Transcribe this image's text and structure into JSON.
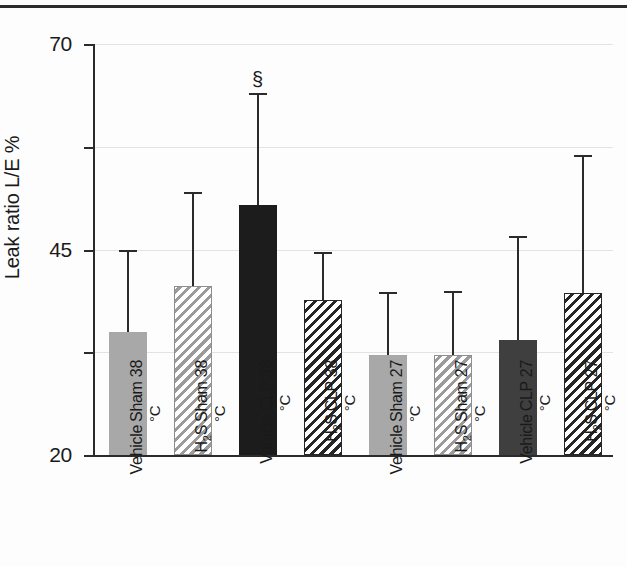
{
  "chart_data": {
    "type": "bar",
    "title": "",
    "subtitle": "",
    "xlabel": "",
    "ylabel": "Leak ratio L/E %",
    "ylim": [
      20,
      70
    ],
    "yticks": [
      20,
      45,
      70
    ],
    "ytick_labels": [
      "20",
      "45",
      "70"
    ],
    "minor_yticks": [
      32.5,
      57.5
    ],
    "grid": true,
    "legend": "none",
    "categories": [
      "Sham 38°C Vehicle",
      "Sham 38°C H2S",
      "CLP 38°C Vehicle",
      "CLP 38°C H2S",
      "Sham 27°C Vehicle",
      "Sham 27°C H2S",
      "CLP 27°C Vehicle",
      "CLP 27°C H2S"
    ],
    "category_lines": [
      [
        "Sham 38",
        "Vehicle"
      ],
      [
        "Sham 38",
        "H₂S"
      ],
      [
        "CLP 38",
        "Vehicle"
      ],
      [
        "CLP 38",
        "H₂S"
      ],
      [
        "Sham 27",
        "Vehicle"
      ],
      [
        "Sham 27",
        "H₂S"
      ],
      [
        "CLP 27",
        "Vehicle"
      ],
      [
        "CLP 27",
        "H₂S"
      ]
    ],
    "values": [
      35.0,
      40.6,
      50.4,
      38.9,
      32.2,
      32.2,
      34.0,
      39.7
    ],
    "error_high": [
      45.0,
      52.0,
      64.0,
      44.7,
      39.8,
      40.0,
      46.6,
      56.5
    ],
    "bar_styles": [
      "solid-light",
      "hatch-light",
      "solid-black",
      "hatch-dark",
      "solid-light",
      "hatch-light",
      "solid-dark",
      "hatch-dark"
    ],
    "annotations": [
      {
        "category_index": 2,
        "text": "§",
        "value": 67.0
      }
    ],
    "colors": {
      "solid_light": "#a8a8a8",
      "solid_dark": "#3f3f3f",
      "solid_black": "#1c1c1c",
      "hatch_light": "#9b9b9b",
      "hatch_dark": "#262626",
      "axis": "#2b2b2b",
      "grid": "#e3e3e3",
      "background": "#fdfdfd"
    }
  }
}
